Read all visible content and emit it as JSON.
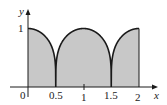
{
  "chart_data": {
    "type": "area",
    "title": "",
    "xlabel": "x",
    "ylabel": "y",
    "function_description": "y = |cos(pi x)|^(1/4) (shaded region under curve)",
    "x": [
      0,
      0.1,
      0.2,
      0.3,
      0.4,
      0.45,
      0.5,
      0.55,
      0.6,
      0.7,
      0.8,
      0.9,
      1.0,
      1.1,
      1.2,
      1.3,
      1.4,
      1.45,
      1.5,
      1.55,
      1.6,
      1.7,
      1.8,
      1.9,
      2.0
    ],
    "values": [
      1,
      0.99,
      0.95,
      0.88,
      0.75,
      0.63,
      0,
      0.63,
      0.75,
      0.88,
      0.95,
      0.99,
      1,
      0.99,
      0.95,
      0.88,
      0.75,
      0.63,
      0,
      0.63,
      0.75,
      0.88,
      0.95,
      0.99,
      1
    ],
    "xticks": [
      "0",
      "0.5",
      "1",
      "1.5",
      "2"
    ],
    "yticks": [
      "1"
    ],
    "xlim": [
      0,
      2.1
    ],
    "ylim": [
      0,
      1.1
    ],
    "grid": false,
    "fill_color": "#c8c8c8",
    "line_color": "#1a1a1a"
  },
  "labels": {
    "x_axis": "x",
    "y_axis": "y",
    "origin": "0",
    "tick_05": "0.5",
    "tick_1": "1",
    "tick_15": "1.5",
    "tick_2": "2",
    "y_tick_1": "1"
  }
}
